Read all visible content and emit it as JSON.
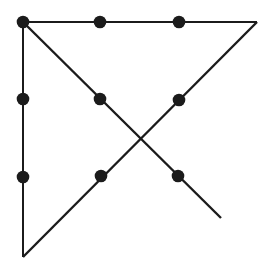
{
  "figure": {
    "name": "nine-dot-puzzle-four-line-solution",
    "canvas": {
      "width": 273,
      "height": 277,
      "background": "#ffffff"
    },
    "ink_color": "#1b1b1b",
    "dot_radius": 6.3,
    "dots": [
      {
        "row": 0,
        "col": 0,
        "x": 23,
        "y": 22
      },
      {
        "row": 0,
        "col": 1,
        "x": 100,
        "y": 22
      },
      {
        "row": 0,
        "col": 2,
        "x": 179,
        "y": 22
      },
      {
        "row": 1,
        "col": 0,
        "x": 23,
        "y": 99
      },
      {
        "row": 1,
        "col": 1,
        "x": 100,
        "y": 99
      },
      {
        "row": 1,
        "col": 2,
        "x": 179,
        "y": 100
      },
      {
        "row": 2,
        "col": 0,
        "x": 23,
        "y": 177
      },
      {
        "row": 2,
        "col": 1,
        "x": 101,
        "y": 176
      },
      {
        "row": 2,
        "col": 2,
        "x": 178,
        "y": 176
      }
    ],
    "lines": [
      {
        "name": "top-horizontal-line",
        "x1": 23,
        "y1": 22,
        "x2": 257,
        "y2": 22,
        "width": 2
      },
      {
        "name": "diagonal-down-left-line",
        "x1": 257,
        "y1": 22,
        "x2": 23,
        "y2": 257,
        "width": 2.4
      },
      {
        "name": "left-vertical-line",
        "x1": 23,
        "y1": 22,
        "x2": 23,
        "y2": 257,
        "width": 2
      },
      {
        "name": "diagonal-down-right-line",
        "x1": 23,
        "y1": 22,
        "x2": 221,
        "y2": 218,
        "width": 2.4
      }
    ]
  }
}
